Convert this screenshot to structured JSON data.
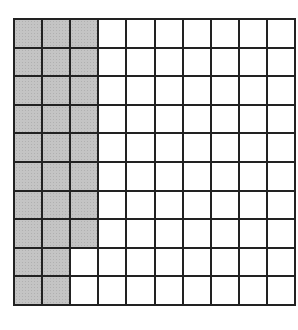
{
  "grid": {
    "rows": 10,
    "cols": 10,
    "shaded_per_row": [
      3,
      3,
      3,
      3,
      3,
      3,
      3,
      3,
      2,
      2
    ],
    "total_cells": 100,
    "shaded_cells": 28,
    "colors": {
      "border": "#222222",
      "shaded": "#c4c4c4",
      "unshaded": "#ffffff"
    }
  }
}
